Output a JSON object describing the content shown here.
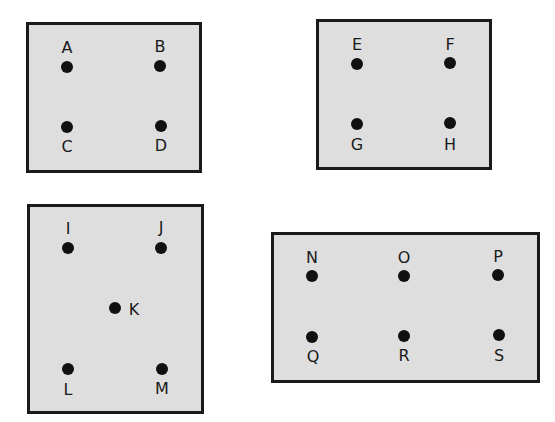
{
  "boxes": [
    {
      "id": "box-1",
      "x": 26,
      "y": 22,
      "w": 176,
      "h": 151,
      "points": [
        {
          "label": "A",
          "x": 67,
          "y": 67,
          "lx": 67,
          "ly": 48
        },
        {
          "label": "B",
          "x": 160,
          "y": 66,
          "lx": 160,
          "ly": 47
        },
        {
          "label": "C",
          "x": 67,
          "y": 127,
          "lx": 67,
          "ly": 147
        },
        {
          "label": "D",
          "x": 161,
          "y": 126,
          "lx": 161,
          "ly": 146
        }
      ]
    },
    {
      "id": "box-2",
      "x": 316,
      "y": 19,
      "w": 176,
      "h": 151,
      "points": [
        {
          "label": "E",
          "x": 357,
          "y": 64,
          "lx": 357,
          "ly": 45
        },
        {
          "label": "F",
          "x": 450,
          "y": 63,
          "lx": 450,
          "ly": 45
        },
        {
          "label": "G",
          "x": 357,
          "y": 124,
          "lx": 357,
          "ly": 145
        },
        {
          "label": "H",
          "x": 450,
          "y": 123,
          "lx": 450,
          "ly": 145
        }
      ]
    },
    {
      "id": "box-3",
      "x": 27,
      "y": 204,
      "w": 177,
      "h": 210,
      "points": [
        {
          "label": "I",
          "x": 68,
          "y": 248,
          "lx": 68,
          "ly": 229
        },
        {
          "label": "J",
          "x": 161,
          "y": 248,
          "lx": 161,
          "ly": 228
        },
        {
          "label": "K",
          "x": 115,
          "y": 308,
          "lx": 134,
          "ly": 310
        },
        {
          "label": "L",
          "x": 68,
          "y": 369,
          "lx": 68,
          "ly": 390
        },
        {
          "label": "M",
          "x": 162,
          "y": 369,
          "lx": 162,
          "ly": 389
        }
      ]
    },
    {
      "id": "box-4",
      "x": 271,
      "y": 232,
      "w": 269,
      "h": 151,
      "points": [
        {
          "label": "N",
          "x": 312,
          "y": 276,
          "lx": 312,
          "ly": 258
        },
        {
          "label": "O",
          "x": 404,
          "y": 276,
          "lx": 404,
          "ly": 258
        },
        {
          "label": "P",
          "x": 498,
          "y": 275,
          "lx": 498,
          "ly": 257
        },
        {
          "label": "Q",
          "x": 312,
          "y": 337,
          "lx": 313,
          "ly": 357
        },
        {
          "label": "R",
          "x": 404,
          "y": 336,
          "lx": 404,
          "ly": 356
        },
        {
          "label": "S",
          "x": 499,
          "y": 335,
          "lx": 499,
          "ly": 356
        }
      ]
    }
  ],
  "colors": {
    "box_fill": "#dedede",
    "border": "#1a1a1a",
    "dot": "#111111"
  }
}
